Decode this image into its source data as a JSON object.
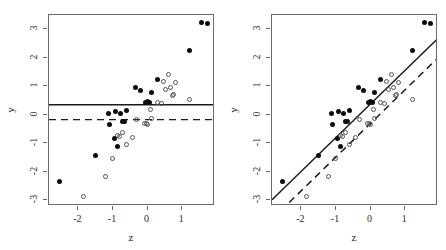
{
  "figure": {
    "type": "scatter-panel-pair",
    "background": "#ffffff",
    "axis_color": "#6b6b6b",
    "filled_color": "#0d0d0d",
    "open_color": "#555555",
    "line_color": "#1a1a1a"
  },
  "chart_data": [
    {
      "type": "scatter",
      "title": "",
      "panel": "left",
      "xlabel": "z",
      "ylabel": "y",
      "xlim": [
        -2.85,
        1.95
      ],
      "ylim": [
        -3.2,
        3.5
      ],
      "xticks": [
        -2,
        -1,
        0,
        1
      ],
      "xticklabels": [
        "-2",
        "-1",
        "0",
        "1"
      ],
      "yticks": [
        -3,
        -2,
        -1,
        0,
        1,
        2,
        3
      ],
      "yticklabels": [
        "-3",
        "-2",
        "-1",
        "0",
        "1",
        "2",
        "3"
      ],
      "grid": false,
      "legend": "none",
      "series": [
        {
          "name": "filled",
          "marker": "filled-circle",
          "points": [
            [
              -2.55,
              -2.33
            ],
            [
              -1.5,
              -1.42
            ],
            [
              -1.12,
              0.05
            ],
            [
              -1.1,
              -0.33
            ],
            [
              -0.97,
              -0.82
            ],
            [
              -0.93,
              0.1
            ],
            [
              -0.88,
              -1.1
            ],
            [
              -0.78,
              0.03
            ],
            [
              -0.72,
              -0.25
            ],
            [
              -0.68,
              -0.22
            ],
            [
              -0.6,
              0.14
            ],
            [
              -0.35,
              0.97
            ],
            [
              -0.2,
              0.86
            ],
            [
              -0.05,
              0.44
            ],
            [
              0.0,
              0.45
            ],
            [
              0.05,
              0.44
            ],
            [
              0.1,
              0.77
            ],
            [
              0.28,
              1.25
            ],
            [
              1.22,
              2.25
            ],
            [
              1.55,
              3.25
            ],
            [
              1.72,
              3.2
            ]
          ]
        },
        {
          "name": "open",
          "marker": "open-circle",
          "points": [
            [
              -1.85,
              -2.87
            ],
            [
              -1.22,
              -2.15
            ],
            [
              -1.0,
              -1.55
            ],
            [
              -0.88,
              -0.72
            ],
            [
              -0.8,
              -0.75
            ],
            [
              -0.72,
              -0.62
            ],
            [
              -0.6,
              -1.05
            ],
            [
              -0.45,
              -0.8
            ],
            [
              -0.33,
              -0.15
            ],
            [
              -0.08,
              -0.3
            ],
            [
              -0.02,
              -0.3
            ],
            [
              0.0,
              -0.33
            ],
            [
              0.08,
              0.17
            ],
            [
              0.1,
              -0.12
            ],
            [
              0.3,
              0.44
            ],
            [
              0.4,
              0.4
            ],
            [
              0.45,
              1.15
            ],
            [
              0.52,
              0.88
            ],
            [
              0.6,
              1.43
            ],
            [
              0.65,
              0.95
            ],
            [
              0.72,
              0.67
            ],
            [
              0.75,
              0.72
            ],
            [
              0.82,
              1.13
            ],
            [
              1.2,
              0.55
            ]
          ]
        }
      ],
      "reference_lines": [
        {
          "name": "solid-horizontal",
          "style": "solid",
          "orientation": "horizontal",
          "y": 0.35
        },
        {
          "name": "dashed-horizontal",
          "style": "dashed",
          "orientation": "horizontal",
          "y": -0.17
        }
      ]
    },
    {
      "type": "scatter",
      "title": "",
      "panel": "right",
      "xlabel": "z",
      "ylabel": "y",
      "xlim": [
        -2.85,
        1.95
      ],
      "ylim": [
        -3.2,
        3.5
      ],
      "xticks": [
        -2,
        -1,
        0,
        1
      ],
      "xticklabels": [
        "-2",
        "-1",
        "0",
        "1"
      ],
      "yticks": [
        -3,
        -2,
        -1,
        0,
        1,
        2,
        3
      ],
      "yticklabels": [
        "-3",
        "-2",
        "-1",
        "0",
        "1",
        "2",
        "3"
      ],
      "grid": false,
      "legend": "none",
      "series": [
        {
          "name": "filled",
          "marker": "filled-circle",
          "points": [
            [
              -2.55,
              -2.33
            ],
            [
              -1.5,
              -1.42
            ],
            [
              -1.12,
              0.05
            ],
            [
              -1.1,
              -0.33
            ],
            [
              -0.97,
              -0.82
            ],
            [
              -0.93,
              0.1
            ],
            [
              -0.88,
              -1.1
            ],
            [
              -0.78,
              0.03
            ],
            [
              -0.72,
              -0.25
            ],
            [
              -0.68,
              -0.22
            ],
            [
              -0.6,
              0.14
            ],
            [
              -0.35,
              0.97
            ],
            [
              -0.2,
              0.86
            ],
            [
              -0.05,
              0.44
            ],
            [
              0.0,
              0.45
            ],
            [
              0.05,
              0.44
            ],
            [
              0.1,
              0.77
            ],
            [
              0.28,
              1.25
            ],
            [
              1.22,
              2.25
            ],
            [
              1.55,
              3.25
            ],
            [
              1.72,
              3.2
            ]
          ]
        },
        {
          "name": "open",
          "marker": "open-circle",
          "points": [
            [
              -1.85,
              -2.87
            ],
            [
              -1.22,
              -2.15
            ],
            [
              -1.0,
              -1.55
            ],
            [
              -0.88,
              -0.72
            ],
            [
              -0.8,
              -0.75
            ],
            [
              -0.72,
              -0.62
            ],
            [
              -0.6,
              -1.05
            ],
            [
              -0.45,
              -0.8
            ],
            [
              -0.33,
              -0.15
            ],
            [
              -0.08,
              -0.3
            ],
            [
              -0.02,
              -0.3
            ],
            [
              0.0,
              -0.33
            ],
            [
              0.08,
              0.17
            ],
            [
              0.1,
              -0.12
            ],
            [
              0.3,
              0.44
            ],
            [
              0.4,
              0.4
            ],
            [
              0.45,
              1.15
            ],
            [
              0.52,
              0.88
            ],
            [
              0.6,
              1.43
            ],
            [
              0.65,
              0.95
            ],
            [
              0.72,
              0.67
            ],
            [
              0.75,
              0.72
            ],
            [
              0.82,
              1.13
            ],
            [
              1.2,
              0.55
            ]
          ]
        }
      ],
      "reference_lines": [
        {
          "name": "solid-regression",
          "style": "solid",
          "orientation": "diagonal",
          "slope": 1.18,
          "intercept": 0.38
        },
        {
          "name": "dashed-regression",
          "style": "dashed",
          "orientation": "diagonal",
          "slope": 1.18,
          "intercept": -0.3
        }
      ]
    }
  ]
}
